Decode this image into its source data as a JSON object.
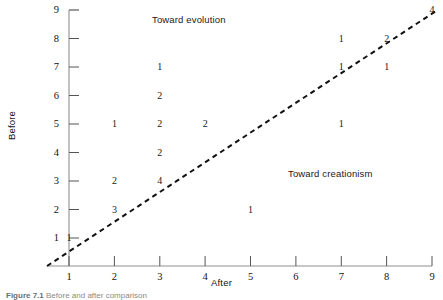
{
  "chart_data": {
    "type": "scatter",
    "title": "",
    "xlabel": "After",
    "ylabel": "Before",
    "xlim": [
      0.5,
      9
    ],
    "ylim": [
      0.5,
      9
    ],
    "xticks": [
      "1",
      "2",
      "3",
      "4",
      "5",
      "6",
      "7",
      "8",
      "9"
    ],
    "yticks": [
      "1",
      "2",
      "3",
      "4",
      "5",
      "6",
      "7",
      "8",
      "9"
    ],
    "grid": false,
    "legend": "none",
    "point_label_meaning": "count of respondents at that (After, Before) cell",
    "points": [
      {
        "x": 1,
        "y": 1,
        "label": "1"
      },
      {
        "x": 2,
        "y": 2,
        "label": "3"
      },
      {
        "x": 2,
        "y": 3,
        "label": "2"
      },
      {
        "x": 2,
        "y": 5,
        "label": "1"
      },
      {
        "x": 3,
        "y": 3,
        "label": "4"
      },
      {
        "x": 3,
        "y": 4,
        "label": "2"
      },
      {
        "x": 3,
        "y": 5,
        "label": "2"
      },
      {
        "x": 3,
        "y": 6,
        "label": "2"
      },
      {
        "x": 3,
        "y": 7,
        "label": "1"
      },
      {
        "x": 4,
        "y": 5,
        "label": "2"
      },
      {
        "x": 5,
        "y": 2,
        "label": "1"
      },
      {
        "x": 7,
        "y": 5,
        "label": "1"
      },
      {
        "x": 7,
        "y": 7,
        "label": "1"
      },
      {
        "x": 7,
        "y": 8,
        "label": "1"
      },
      {
        "x": 8,
        "y": 7,
        "label": "1"
      },
      {
        "x": 8,
        "y": 8,
        "label": "2"
      },
      {
        "x": 9,
        "y": 9,
        "label": "4"
      }
    ],
    "reference_line": {
      "name": "identity-line",
      "style": "dashed",
      "from": [
        0.5,
        0.5
      ],
      "to": [
        9,
        9
      ],
      "color": "#111111"
    },
    "annotations": [
      {
        "name": "toward-evolution",
        "text": "Toward evolution",
        "x": 3.0,
        "y": 8.6
      },
      {
        "name": "toward-creationism",
        "text": "Toward creationism",
        "x": 6.1,
        "y": 3.45
      }
    ],
    "axis_color": "#8f8f8f"
  },
  "caption": {
    "label": "Figure 7.1",
    "text": "Before and after comparison"
  }
}
